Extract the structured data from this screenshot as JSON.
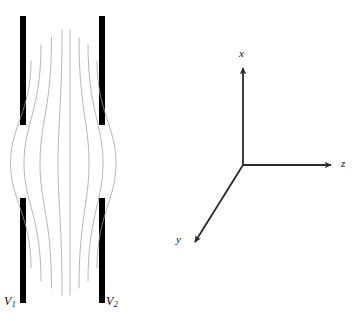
{
  "figure": {
    "background_color": "#ffffff",
    "width": 358,
    "height": 321
  },
  "capacitor": {
    "description": "Two pairs of vertical plate segments with fringing field lines bulging outward through the gap",
    "plate_color": "#111111",
    "plate_width": 6,
    "plates": [
      {
        "name": "upper-left-plate",
        "x": 20,
        "y": 16,
        "w": 6,
        "h": 109
      },
      {
        "name": "upper-right-plate",
        "x": 99,
        "y": 16,
        "w": 6,
        "h": 109
      },
      {
        "name": "lower-left-plate",
        "x": 20,
        "y": 198,
        "w": 6,
        "h": 105
      },
      {
        "name": "lower-right-plate",
        "x": 99,
        "y": 198,
        "w": 6,
        "h": 105
      }
    ],
    "labels": {
      "left_plate": "V",
      "left_plate_sub": "1",
      "right_plate": "V",
      "right_plate_sub": "2"
    },
    "field_lines": {
      "count": 8,
      "color": "#9a9a9a",
      "stroke_width": 0.7,
      "gap_center_y": 163,
      "paths": [
        {
          "name": "field-line-1",
          "top_x": 31,
          "top_y": 61,
          "bulge_x": 10.5,
          "bottom_x": 31,
          "bottom_y": 268
        },
        {
          "name": "field-line-2",
          "top_x": 41,
          "top_y": 45,
          "bulge_x": 24,
          "bottom_x": 41,
          "bottom_y": 281
        },
        {
          "name": "field-line-3",
          "top_x": 51.5,
          "top_y": 38,
          "bulge_x": 40,
          "bottom_x": 51.5,
          "bottom_y": 288
        },
        {
          "name": "field-line-4",
          "top_x": 62,
          "top_y": 30,
          "bulge_x": 58,
          "bottom_x": 62,
          "bottom_y": 295
        },
        {
          "name": "field-line-5",
          "top_x": 70,
          "top_y": 30,
          "bulge_x": 70,
          "bottom_x": 70,
          "bottom_y": 295
        },
        {
          "name": "field-line-6",
          "top_x": 79,
          "top_y": 38,
          "bulge_x": 89,
          "bottom_x": 79,
          "bottom_y": 288
        },
        {
          "name": "field-line-7",
          "top_x": 88,
          "top_y": 45,
          "bulge_x": 103,
          "bottom_x": 88,
          "bottom_y": 281
        },
        {
          "name": "field-line-8",
          "top_x": 97,
          "top_y": 61,
          "bulge_x": 116,
          "bottom_x": 97,
          "bottom_y": 268
        }
      ]
    }
  },
  "axes": {
    "description": "Right-handed 3D coordinate frame",
    "line_color": "#2a2a2a",
    "stroke_width": 1.8,
    "origin": {
      "x": 243,
      "y": 165
    },
    "arrows": [
      {
        "name": "x-axis",
        "label": "x",
        "tip_x": 243,
        "tip_y": 63,
        "direction": "up"
      },
      {
        "name": "z-axis",
        "label": "z",
        "tip_x": 337,
        "tip_y": 165,
        "direction": "right"
      },
      {
        "name": "y-axis",
        "label": "y",
        "tip_x": 190,
        "tip_y": 246,
        "direction": "down-left"
      }
    ]
  }
}
